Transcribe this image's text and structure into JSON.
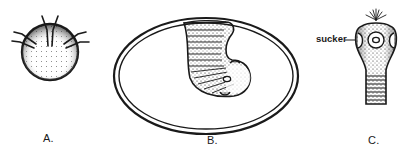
{
  "figure": {
    "panels": [
      {
        "id": "A",
        "label": "A."
      },
      {
        "id": "B",
        "label": "B."
      },
      {
        "id": "C",
        "label": "C.",
        "callouts": [
          {
            "text": "sucker"
          }
        ]
      }
    ]
  },
  "colors": {
    "ink": "#1a1a1a",
    "background": "#ffffff"
  }
}
